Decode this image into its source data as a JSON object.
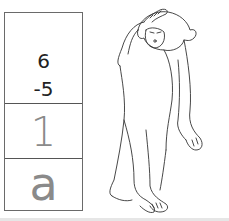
{
  "worksheet": {
    "problem": {
      "minuend": "6",
      "subtrahend": "-5"
    },
    "answer": "1",
    "code_letter": "a"
  },
  "illustration": {
    "subject": "monkey-scratching-head-icon"
  },
  "colors": {
    "border": "#6a6a6a",
    "answer_text": "#8a8a8a",
    "problem_text": "#222222"
  }
}
